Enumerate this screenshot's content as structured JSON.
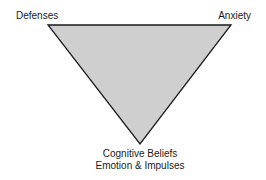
{
  "diagram": {
    "shape": "inverted-triangle",
    "fill_color": "#cfcfcf",
    "stroke_color": "#1a1a1a",
    "vertices": {
      "top_left": {
        "label": "Defenses"
      },
      "top_right": {
        "label": "Anxiety"
      },
      "bottom": {
        "label_line1": "Cognitive Beliefs",
        "label_line2": "Emotion & Impulses"
      }
    }
  }
}
